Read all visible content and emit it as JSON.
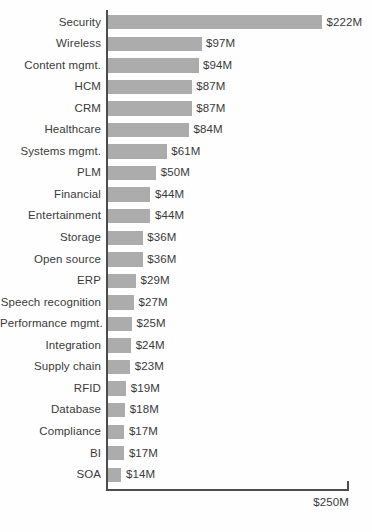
{
  "chart_data": {
    "type": "bar",
    "orientation": "horizontal",
    "title": "",
    "xlabel": "",
    "ylabel": "",
    "xlim": [
      0,
      250
    ],
    "unit": "$M",
    "grid": false,
    "legend": false,
    "axis_max_label": "$250M",
    "bar_color": "#acacac",
    "text_color": "#3a3a3a",
    "axis_color": "#4d4d4d",
    "background_color": "#fefefe",
    "categories": [
      "Security",
      "Wireless",
      "Content mgmt.",
      "HCM",
      "CRM",
      "Healthcare",
      "Systems mgmt.",
      "PLM",
      "Financial",
      "Entertainment",
      "Storage",
      "Open source",
      "ERP",
      "Speech recognition",
      "Performance mgmt.",
      "Integration",
      "Supply chain",
      "RFID",
      "Database",
      "Compliance",
      "BI",
      "SOA"
    ],
    "values": [
      222,
      97,
      94,
      87,
      87,
      84,
      61,
      50,
      44,
      44,
      36,
      36,
      29,
      27,
      25,
      24,
      23,
      19,
      18,
      17,
      17,
      14
    ],
    "value_labels": [
      "$222M",
      "$97M",
      "$94M",
      "$87M",
      "$87M",
      "$84M",
      "$61M",
      "$50M",
      "$44M",
      "$44M",
      "$36M",
      "$36M",
      "$29M",
      "$27M",
      "$25M",
      "$24M",
      "$23M",
      "$19M",
      "$18M",
      "$17M",
      "$17M",
      "$14M"
    ]
  }
}
